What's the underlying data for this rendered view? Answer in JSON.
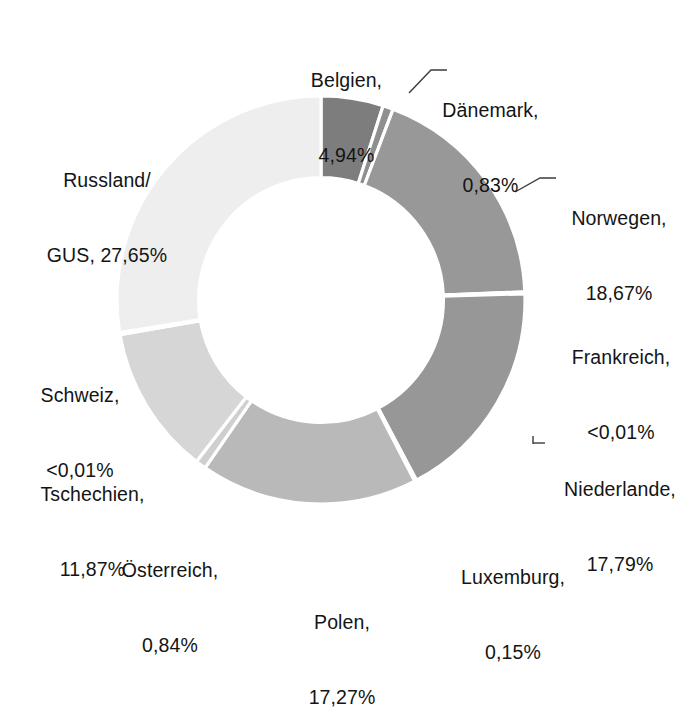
{
  "chart_data": {
    "type": "pie",
    "variant": "donut",
    "title": "",
    "subtitle": "",
    "xlabel": "",
    "ylabel": "",
    "legend_position": "none",
    "grid": false,
    "label_format": "name, value%",
    "decimal_separator": ",",
    "start_angle_deg": 0,
    "direction": "clockwise",
    "inner_radius_ratio": 0.6,
    "categories": [
      "Belgien",
      "Dänemark",
      "Norwegen",
      "Frankreich",
      "Niederlande",
      "Luxemburg",
      "Polen",
      "Österreich",
      "Tschechien",
      "Schweiz",
      "Russland/GUS"
    ],
    "values": [
      4.94,
      0.83,
      18.67,
      0.005,
      17.79,
      0.15,
      17.27,
      0.84,
      11.87,
      0.005,
      27.65
    ],
    "value_labels": [
      "4,94%",
      "0,83%",
      "18,67%",
      "<0,01%",
      "17,79%",
      "0,15%",
      "17,27%",
      "0,84%",
      "11,87%",
      "<0,01%",
      "27,65%"
    ],
    "colors": [
      "#7d7d7d",
      "#8f8f8f",
      "#989898",
      "#989898",
      "#979797",
      "#a8a8a8",
      "#b9b9b9",
      "#cfcfcf",
      "#d6d6d6",
      "#e3e3e3",
      "#eeeeee"
    ],
    "slice_border_color": "#ffffff",
    "leader_line_color": "#3c3c3c"
  },
  "labels": {
    "belgien": {
      "name": "Belgien,",
      "value": "4,94%"
    },
    "daenemark": {
      "name": "Dänemark,",
      "value": "0,83%"
    },
    "norwegen": {
      "name": "Norwegen,",
      "value": "18,67%"
    },
    "frankreich": {
      "name": "Frankreich,",
      "value": "<0,01%"
    },
    "niederlande": {
      "name": "Niederlande,",
      "value": "17,79%"
    },
    "luxemburg": {
      "name": "Luxemburg,",
      "value": "0,15%"
    },
    "polen": {
      "name": "Polen,",
      "value": "17,27%"
    },
    "oesterreich": {
      "name": "Österreich,",
      "value": "0,84%"
    },
    "tschechien": {
      "name": "Tschechien,",
      "value": "11,87%"
    },
    "schweiz": {
      "name": "Schweiz,",
      "value": "<0,01%"
    },
    "russland": {
      "name": "Russland/",
      "value": "GUS, 27,65%"
    }
  }
}
